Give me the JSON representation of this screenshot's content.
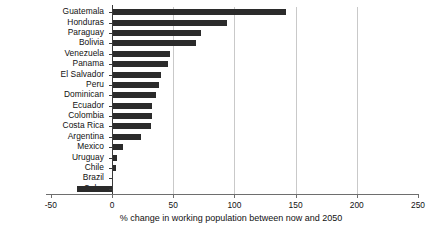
{
  "chart_data": {
    "type": "bar",
    "orientation": "horizontal",
    "title": "",
    "xlabel": "% change in working population between now and 2050",
    "ylabel": "",
    "xlim": [
      -50,
      250
    ],
    "xticks": [
      -50,
      0,
      50,
      100,
      150,
      200,
      250
    ],
    "xticklabels": [
      "-50",
      "0",
      "50",
      "100",
      "150",
      "200",
      "250"
    ],
    "gridlines": [
      50,
      100,
      150,
      200
    ],
    "grid": true,
    "legend": false,
    "bar_color": "#2b2b2b",
    "categories": [
      "Guatemala",
      "Honduras",
      "Paraguay",
      "Bolivia",
      "Venezuela",
      "Panama",
      "El Salvador",
      "Peru",
      "Dominican",
      "Ecuador",
      "Colombia",
      "Costa Rica",
      "Argentina",
      "Mexico",
      "Uruguay",
      "Chile",
      "Brazil",
      "Cuba"
    ],
    "values": [
      142,
      94,
      73,
      69,
      47,
      46,
      40,
      38,
      36,
      33,
      33,
      32,
      24,
      9,
      4,
      3,
      1,
      -29
    ]
  }
}
